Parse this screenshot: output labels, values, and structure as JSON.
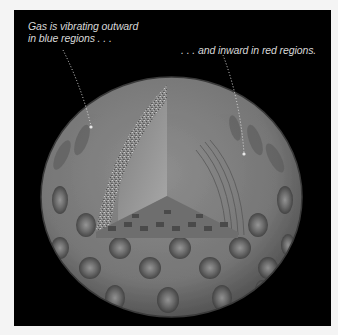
{
  "figure": {
    "background_color": "#000000",
    "border_color": "#f4f4f4",
    "sphere_tone": "#808080",
    "annotations": [
      {
        "id": "outward",
        "line1": "Gas is vibrating outward",
        "line2": "in blue regions . . .",
        "leader": {
          "from": [
            63,
            50
          ],
          "to": [
            91,
            126
          ]
        }
      },
      {
        "id": "inward",
        "line1": ". . . and inward in red regions.",
        "leader": {
          "from": [
            223,
            55
          ],
          "to": [
            244,
            153
          ]
        }
      }
    ]
  }
}
